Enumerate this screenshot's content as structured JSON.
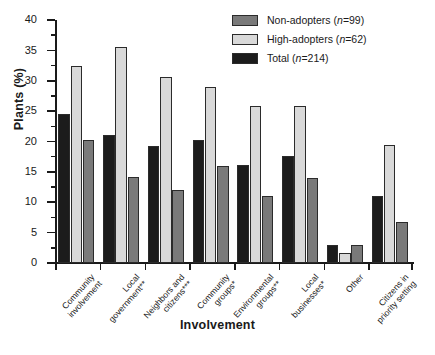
{
  "chart_data": {
    "type": "bar",
    "title": "",
    "xlabel": "Involvement",
    "ylabel": "Plants (%)",
    "ylim": [
      0,
      40
    ],
    "ytick_step": 5,
    "yticks": [
      0,
      5,
      10,
      15,
      20,
      25,
      30,
      35,
      40
    ],
    "grid": false,
    "legend_position": "top-right",
    "categories": [
      "Community\ninvolvement",
      "Local\ngovernment**",
      "Neighbors and\ncitizens***",
      "Community\ngroups*",
      "Environmental\ngroups**",
      "Local\nbusinesses*",
      "Other",
      "Citizens in\npriority setting"
    ],
    "series": [
      {
        "name": "Total",
        "legend_label": "Total (n=214)",
        "legend_name": "Total",
        "legend_n": "(n=214)",
        "color": "#1c1c1c",
        "values": [
          24.5,
          21.1,
          19.3,
          20.2,
          16.2,
          17.6,
          3.0,
          11.1
        ]
      },
      {
        "name": "High-adopters",
        "legend_label": "High-adopters (n=62)",
        "legend_name": "High-adopters",
        "legend_n": "(n=62)",
        "color": "#d9d9d9",
        "values": [
          32.5,
          35.6,
          30.6,
          29.0,
          25.9,
          25.8,
          1.6,
          19.4
        ]
      },
      {
        "name": "Non-adopters",
        "legend_label": "Non-adopters (n=99)",
        "legend_name": "Non-adopters",
        "legend_n": "(n=99)",
        "color": "#7a7a7a",
        "values": [
          20.3,
          14.2,
          12.0,
          16.0,
          11.0,
          14.0,
          3.0,
          6.8
        ]
      }
    ],
    "legend_order": [
      "Non-adopters",
      "High-adopters",
      "Total"
    ],
    "bar_draw_order": [
      "Total",
      "High-adopters",
      "Non-adopters"
    ]
  }
}
